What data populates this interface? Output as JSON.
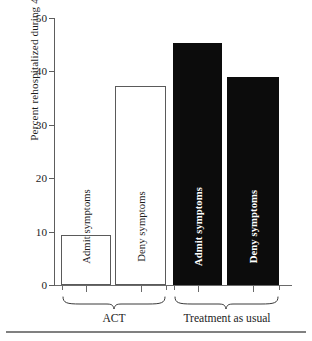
{
  "chart_data": {
    "type": "bar",
    "title": "",
    "xlabel": "",
    "ylabel": "Percent rehospitalized during 4-month follow-up",
    "ylim": [
      0,
      50
    ],
    "yticks": [
      0,
      10,
      20,
      30,
      40,
      50
    ],
    "ytick_labels": [
      "0",
      "10",
      "20",
      "30",
      "40",
      "50"
    ],
    "grid": false,
    "legend": "none",
    "groups": [
      {
        "label": "ACT",
        "style": "open"
      },
      {
        "label": "Treatment as usual",
        "style": "filled"
      }
    ],
    "categories": [
      "Admit symptoms",
      "Deny symptoms",
      "Admit symptoms",
      "Deny symptoms"
    ],
    "values": [
      9.3,
      37.3,
      45.3,
      39.0
    ],
    "bars": [
      {
        "label": "Admit symptoms",
        "value": 9.3,
        "group": "ACT",
        "style": "open"
      },
      {
        "label": "Deny symptoms",
        "value": 37.3,
        "group": "ACT",
        "style": "open"
      },
      {
        "label": "Admit symptoms",
        "value": 45.3,
        "group": "Treatment as usual",
        "style": "filled"
      },
      {
        "label": "Deny symptoms",
        "value": 39.0,
        "group": "Treatment as usual",
        "style": "filled"
      }
    ],
    "colors": {
      "open_fill": "#ffffff",
      "open_stroke": "#5a5a5a",
      "filled_fill": "#0c0c0c",
      "axis": "#5d5d5d",
      "text": "#1d1d1d",
      "inverse_text": "#ffffff"
    }
  }
}
